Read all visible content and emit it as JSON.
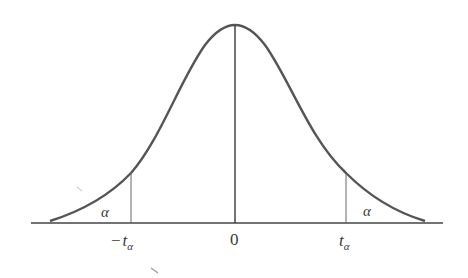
{
  "diagram": {
    "type": "t-distribution two-tailed critical regions",
    "colors": {
      "curve": "#555555",
      "axis": "#444444",
      "lines": "#666666",
      "text": "#3a3a3a"
    },
    "labels": {
      "left_critical": {
        "sign": "−",
        "symbol": "t",
        "subscript": "α"
      },
      "center": "0",
      "right_critical": {
        "symbol": "t",
        "subscript": "α"
      },
      "left_tail_area": "α",
      "right_tail_area": "α"
    }
  }
}
